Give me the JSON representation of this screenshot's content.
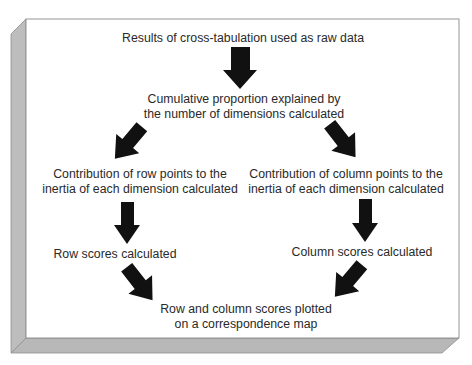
{
  "diagram": {
    "type": "flowchart",
    "colors": {
      "panel": "#ffffff",
      "bevel": "#bdbdbd",
      "bevel_dark": "#9a9a9a",
      "arrow": "#111111",
      "text": "#2a2a2a"
    },
    "nodes": {
      "raw_data": {
        "lines": [
          "Results of cross-tabulation used as raw data"
        ]
      },
      "cumulative": {
        "lines": [
          "Cumulative proportion explained by",
          "the number of dimensions calculated"
        ]
      },
      "row_contribution": {
        "lines": [
          "Contribution of row points to the",
          "inertia of each dimension calculated"
        ]
      },
      "column_contribution": {
        "lines": [
          "Contribution of column points to the",
          "inertia of each dimension calculated"
        ]
      },
      "row_scores": {
        "lines": [
          "Row scores calculated"
        ]
      },
      "column_scores": {
        "lines": [
          "Column scores calculated"
        ]
      },
      "plot": {
        "lines": [
          "Row and column scores plotted",
          "on a correspondence map"
        ]
      }
    },
    "edges": [
      {
        "from": "raw_data",
        "to": "cumulative"
      },
      {
        "from": "cumulative",
        "to": "row_contribution"
      },
      {
        "from": "cumulative",
        "to": "column_contribution"
      },
      {
        "from": "row_contribution",
        "to": "row_scores"
      },
      {
        "from": "column_contribution",
        "to": "column_scores"
      },
      {
        "from": "row_scores",
        "to": "plot"
      },
      {
        "from": "column_scores",
        "to": "plot"
      }
    ]
  }
}
